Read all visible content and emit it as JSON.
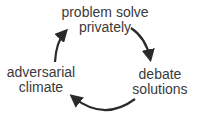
{
  "diagram": {
    "type": "cycle",
    "nodes": [
      {
        "id": "top",
        "lines": [
          "problem solve",
          "privately"
        ]
      },
      {
        "id": "right",
        "lines": [
          "debate",
          "solutions"
        ]
      },
      {
        "id": "left",
        "lines": [
          "adversarial",
          "climate"
        ]
      }
    ],
    "edges": [
      {
        "from": "top",
        "to": "right"
      },
      {
        "from": "right",
        "to": "left"
      },
      {
        "from": "left",
        "to": "top"
      }
    ],
    "colors": {
      "text": "#3a3a3a",
      "arrow": "#2a2a2a",
      "background": "#ffffff"
    }
  }
}
